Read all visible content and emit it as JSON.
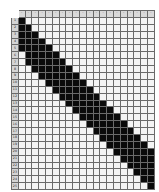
{
  "diagram": {
    "type": "pattern-chart",
    "columns": 20,
    "rows": 25,
    "colors": {
      "filled": "#0a0a0a",
      "empty": "#f4f4f4",
      "gridline": "#6a6a6a",
      "header": "#d9d9d9"
    },
    "header_symbols": [
      "◦",
      "◦",
      "◦",
      "◦",
      "◦",
      "◦",
      "◦",
      "◦",
      "◦",
      "◦",
      "◦",
      "◦",
      "◦",
      "◦",
      "◦",
      "◦",
      "◦",
      "◦",
      "◦",
      "◦"
    ],
    "row_labels": [
      "1",
      "2",
      "3",
      "4",
      "5",
      "6",
      "7",
      "8",
      "9",
      "10",
      "11",
      "12",
      "13",
      "14",
      "15",
      "16",
      "17",
      "18",
      "19",
      "20",
      "21",
      "22",
      "23",
      "24",
      "25"
    ],
    "filled_ranges": [
      {
        "row": 1,
        "start": 1,
        "end": 1
      },
      {
        "row": 2,
        "start": 1,
        "end": 2
      },
      {
        "row": 3,
        "start": 1,
        "end": 3
      },
      {
        "row": 4,
        "start": 1,
        "end": 4
      },
      {
        "row": 5,
        "start": 1,
        "end": 5
      },
      {
        "row": 6,
        "start": 2,
        "end": 6
      },
      {
        "row": 7,
        "start": 2,
        "end": 7
      },
      {
        "row": 8,
        "start": 3,
        "end": 8
      },
      {
        "row": 9,
        "start": 4,
        "end": 9
      },
      {
        "row": 10,
        "start": 5,
        "end": 10
      },
      {
        "row": 11,
        "start": 6,
        "end": 11
      },
      {
        "row": 12,
        "start": 7,
        "end": 12
      },
      {
        "row": 13,
        "start": 8,
        "end": 13
      },
      {
        "row": 14,
        "start": 9,
        "end": 14
      },
      {
        "row": 15,
        "start": 10,
        "end": 15
      },
      {
        "row": 16,
        "start": 11,
        "end": 16
      },
      {
        "row": 17,
        "start": 12,
        "end": 17
      },
      {
        "row": 18,
        "start": 13,
        "end": 18
      },
      {
        "row": 19,
        "start": 14,
        "end": 19
      },
      {
        "row": 20,
        "start": 15,
        "end": 20
      },
      {
        "row": 21,
        "start": 16,
        "end": 20
      },
      {
        "row": 22,
        "start": 17,
        "end": 20
      },
      {
        "row": 23,
        "start": 18,
        "end": 20
      },
      {
        "row": 24,
        "start": 19,
        "end": 20
      },
      {
        "row": 25,
        "start": 20,
        "end": 20
      }
    ]
  }
}
